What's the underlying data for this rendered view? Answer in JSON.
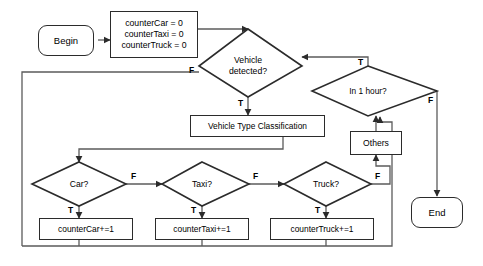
{
  "diagram": {
    "type": "flowchart",
    "stroke_color": "#2b2b2b",
    "text_color": "#000000",
    "background_color": "#ffffff"
  },
  "nodes": {
    "begin": {
      "label": "Begin",
      "shape": "terminator"
    },
    "init": {
      "line1": "counterCar = 0",
      "line2": "counterTaxi = 0",
      "line3": "counterTruck = 0",
      "shape": "process"
    },
    "vehicle_detected": {
      "line1": "Vehicle",
      "line2": "detected?",
      "shape": "decision"
    },
    "in_one_hour": {
      "label": "In 1 hour?",
      "shape": "decision"
    },
    "classification": {
      "label": "Vehicle Type Classification",
      "shape": "process"
    },
    "car": {
      "label": "Car?",
      "shape": "decision"
    },
    "taxi": {
      "label": "Taxi?",
      "shape": "decision"
    },
    "truck": {
      "label": "Truck?",
      "shape": "decision"
    },
    "others": {
      "label": "Others",
      "shape": "process"
    },
    "counter_car": {
      "label": "counterCar+=1",
      "shape": "process"
    },
    "counter_taxi": {
      "label": "counterTaxi+=1",
      "shape": "process"
    },
    "counter_truck": {
      "label": "counterTruck+=1",
      "shape": "process"
    },
    "end": {
      "label": "End",
      "shape": "terminator"
    }
  },
  "edge_labels": {
    "vehicle_detected_false": "F",
    "vehicle_detected_true": "T",
    "in_one_hour_true": "T",
    "in_one_hour_false": "F",
    "car_false": "F",
    "car_true": "T",
    "taxi_false": "F",
    "taxi_true": "T",
    "truck_false": "F",
    "truck_true": "T"
  }
}
